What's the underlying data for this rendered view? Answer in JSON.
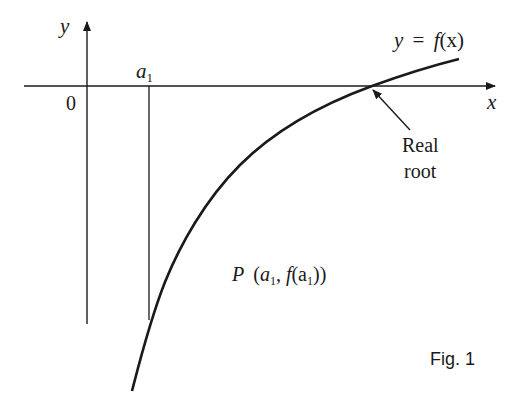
{
  "figure": {
    "caption": "Fig. 1",
    "axes": {
      "x_label": "x",
      "y_label": "y",
      "origin_label": "0"
    },
    "curve_label": {
      "y": "y",
      "eq": "=",
      "f": "f",
      "arg": "(x)"
    },
    "a1_label": {
      "base": "a",
      "sub": "1"
    },
    "root_annotation": {
      "line1": "Real",
      "line2": "root"
    },
    "point_label": {
      "P": "P",
      "open": "(",
      "a": "a",
      "sub1": "1",
      "comma": ", ",
      "f": "f",
      "open2": "(a",
      "sub2": "1",
      "close": "))"
    },
    "colors": {
      "stroke": "#1a1a1a",
      "background": "#ffffff"
    }
  }
}
